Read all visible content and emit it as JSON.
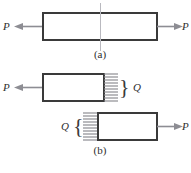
{
  "figure": {
    "background_color": "#ffffff",
    "stroke_color": "#3a3a3a",
    "arrow_color": "#8d8d93",
    "cutline_color": "#b9b9bf",
    "panels": [
      {
        "id": "a",
        "caption": "(a)",
        "description": "Axially loaded prismatic bar in tension with a transverse cut plane through its midsection",
        "labels": {
          "left_force": "P",
          "right_force": "P"
        }
      },
      {
        "id": "b",
        "caption": "(b)",
        "description": "Free body diagrams of the two severed segments showing the internal distributed resultant Q on each cut face",
        "labels": {
          "left_force": "P",
          "right_force": "P",
          "upper_internal_force": "Q",
          "lower_internal_force": "Q"
        }
      }
    ],
    "hatch": {
      "line_count": 10,
      "meaning": "distributed internal stress arrows on cut surface"
    }
  }
}
